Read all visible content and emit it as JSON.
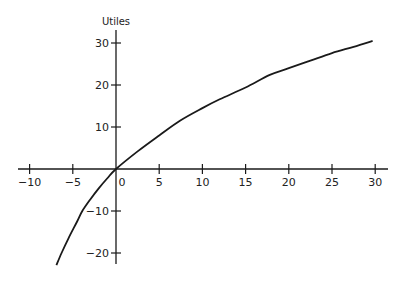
{
  "chart_data": {
    "type": "line",
    "title": "",
    "xlabel": "",
    "ylabel": "Utiles",
    "xlim": [
      -12,
      31.5
    ],
    "ylim": [
      -23,
      33
    ],
    "x_ticks": [
      -10,
      -5,
      0,
      5,
      10,
      15,
      20,
      25,
      30
    ],
    "x_tick_labels": [
      "−10",
      "−5",
      "0",
      "5",
      "10",
      "15",
      "20",
      "25",
      "30"
    ],
    "y_ticks": [
      30,
      20,
      10,
      -10,
      -20
    ],
    "y_tick_labels": [
      "30",
      "20",
      "10",
      "−10",
      "−20"
    ],
    "grid": false,
    "legend": null,
    "series": [
      {
        "name": "utility curve",
        "color": "#1a1a1a",
        "x": [
          -6.9,
          -6.3,
          -5.5,
          -4.5,
          -3.9,
          -3,
          -2,
          -1,
          0,
          2.5,
          5,
          7.4,
          10,
          12,
          15,
          17.8,
          20,
          22.5,
          25,
          27.5,
          29.7
        ],
        "y": [
          -22.9,
          -20,
          -16.5,
          -12.5,
          -10,
          -7.3,
          -4.6,
          -2.2,
          0,
          4.2,
          8,
          11.5,
          14.5,
          16.6,
          19.4,
          22.4,
          24,
          25.8,
          27.6,
          29.1,
          30.5
        ]
      }
    ]
  }
}
